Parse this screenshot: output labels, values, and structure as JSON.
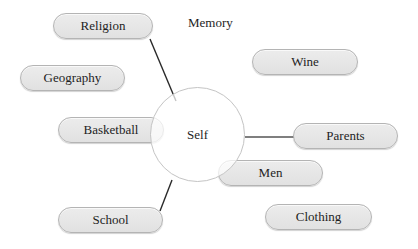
{
  "diagram": {
    "type": "mind-map",
    "center": {
      "label": "Self"
    },
    "free_label": "Memory",
    "nodes": [
      {
        "id": "religion",
        "label": "Religion",
        "connected": true
      },
      {
        "id": "geography",
        "label": "Geography",
        "connected": false
      },
      {
        "id": "basketball",
        "label": "Basketball",
        "connected": false
      },
      {
        "id": "school",
        "label": "School",
        "connected": true
      },
      {
        "id": "wine",
        "label": "Wine",
        "connected": false
      },
      {
        "id": "parents",
        "label": "Parents",
        "connected": true
      },
      {
        "id": "men",
        "label": "Men",
        "connected": false
      },
      {
        "id": "clothing",
        "label": "Clothing",
        "connected": false
      }
    ],
    "colors": {
      "pill_fill": "#e6e6e6",
      "pill_border": "#b4b4b4",
      "circle_border": "#c4c4c4",
      "line": "#2a2a2a"
    }
  }
}
